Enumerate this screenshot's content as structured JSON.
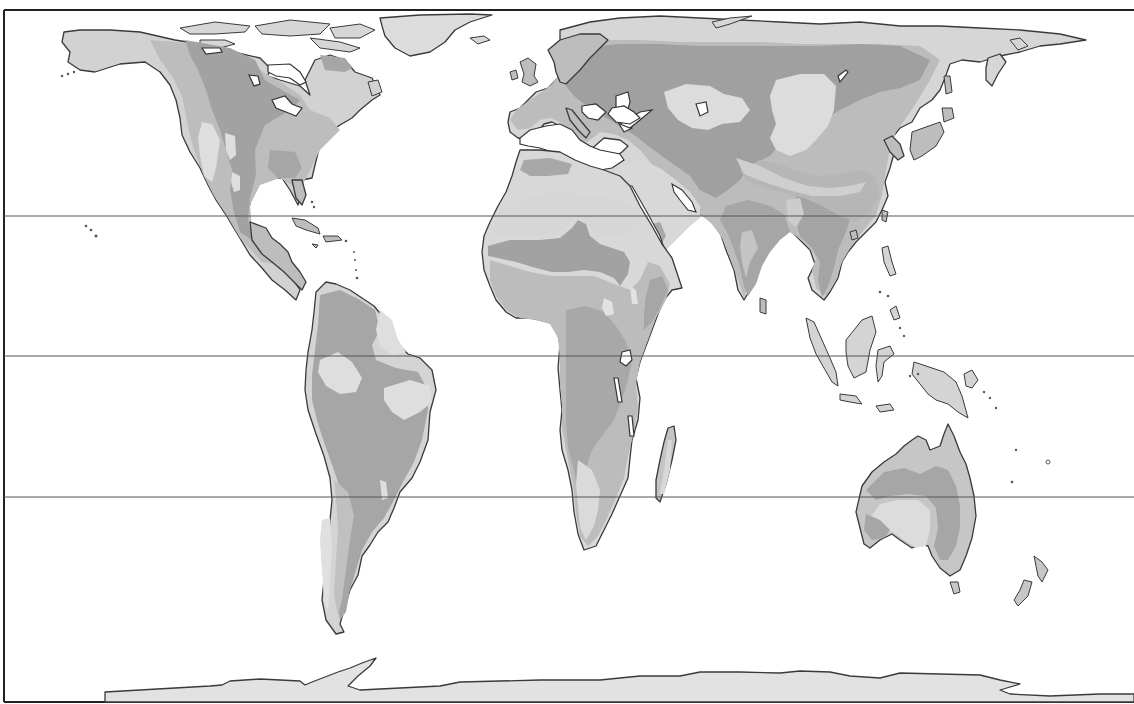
{
  "map": {
    "type": "thematic world map (grayscale, equal-area projection)",
    "legend": [],
    "colors": {
      "ocean": "#ffffff",
      "zone_light": "#dcdcdc",
      "zone_medium": "#bdbdbd",
      "zone_dark": "#9e9e9e",
      "coastline": "#3a3a3a",
      "frame": "#222222",
      "reference_lines": "#555555"
    },
    "reference_lines_y": [
      216,
      356,
      497
    ],
    "reference_lines_meaning": [
      "Tropic of Cancer",
      "Equator",
      "Tropic of Capricorn"
    ],
    "landmasses": [
      "North America",
      "Greenland",
      "South America",
      "Europe",
      "Africa",
      "Asia",
      "Australia",
      "New Zealand",
      "Madagascar",
      "Japan",
      "Southeast Asian islands",
      "Antarctica"
    ],
    "text_labels": []
  }
}
